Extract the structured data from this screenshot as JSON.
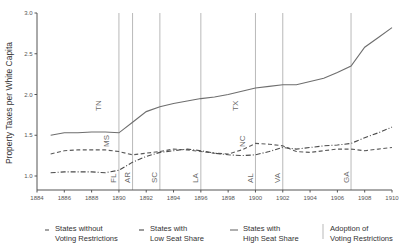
{
  "chart_data": {
    "type": "line",
    "title": "",
    "xlabel": "",
    "ylabel": "Property Taxes per White Capita",
    "xlim": [
      1884,
      1910
    ],
    "ylim": [
      0.9,
      3.05
    ],
    "xticks": [
      1884,
      1886,
      1888,
      1890,
      1892,
      1894,
      1896,
      1898,
      1900,
      1902,
      1904,
      1906,
      1908,
      1910
    ],
    "yticks": [
      1.0,
      1.5,
      2.0,
      2.5,
      3.0
    ],
    "ytick_labels": [
      "1.0",
      "1.5",
      "2.0",
      "2.5",
      "3.0"
    ],
    "xtick_labels": [
      "1884",
      "1886",
      "1888",
      "1890",
      "1892",
      "1894",
      "1896",
      "1898",
      "1900",
      "1902",
      "1904",
      "1906",
      "1908",
      "1910"
    ],
    "grid": false,
    "legend_position": "bottom",
    "x": [
      1885,
      1886,
      1887,
      1888,
      1889,
      1890,
      1891,
      1892,
      1893,
      1894,
      1895,
      1896,
      1897,
      1898,
      1899,
      1900,
      1901,
      1902,
      1903,
      1904,
      1905,
      1906,
      1907,
      1908,
      1909,
      1910
    ],
    "series": [
      {
        "name": "States with High Seat Share",
        "style": "solid",
        "values": [
          1.5,
          1.53,
          1.53,
          1.54,
          1.54,
          1.53,
          1.66,
          1.79,
          1.85,
          1.89,
          1.92,
          1.95,
          1.97,
          2.0,
          2.04,
          2.08,
          2.1,
          2.12,
          2.12,
          2.16,
          2.2,
          2.27,
          2.35,
          2.58,
          2.7,
          2.82
        ]
      },
      {
        "name": "States without Voting Restrictions",
        "style": "dashed",
        "values": [
          1.27,
          1.31,
          1.32,
          1.32,
          1.32,
          1.3,
          1.26,
          1.28,
          1.3,
          1.33,
          1.32,
          1.3,
          1.28,
          1.27,
          1.32,
          1.4,
          1.39,
          1.37,
          1.3,
          1.29,
          1.31,
          1.33,
          1.33,
          1.31,
          1.33,
          1.35
        ]
      },
      {
        "name": "States with Low Seat Share",
        "style": "dashdot",
        "values": [
          1.04,
          1.05,
          1.05,
          1.05,
          1.04,
          1.07,
          1.17,
          1.24,
          1.29,
          1.31,
          1.33,
          1.31,
          1.28,
          1.26,
          1.25,
          1.26,
          1.3,
          1.35,
          1.33,
          1.35,
          1.37,
          1.38,
          1.4,
          1.47,
          1.53,
          1.6
        ]
      }
    ],
    "vertical_lines": [
      {
        "year": 1890,
        "labels": [
          "FL",
          "MS",
          "TN"
        ]
      },
      {
        "year": 1891,
        "labels": [
          "AR"
        ]
      },
      {
        "year": 1893,
        "labels": [
          "SC"
        ]
      },
      {
        "year": 1896,
        "labels": [
          "LA"
        ]
      },
      {
        "year": 1900,
        "labels": [
          "AL",
          "NC",
          "TX"
        ]
      },
      {
        "year": 1902,
        "labels": [
          "VA"
        ]
      },
      {
        "year": 1907,
        "labels": [
          "GA"
        ]
      }
    ]
  },
  "legend": {
    "entries": [
      {
        "line1": "States without",
        "line2": "Voting Restrictions",
        "marker": "dashed"
      },
      {
        "line1": "States with",
        "line2": "Low Seat Share",
        "marker": "dashdot"
      },
      {
        "line1": "States with",
        "line2": "High Seat Share",
        "marker": "solid"
      },
      {
        "line1": "Adoption of",
        "line2": "Voting Restrictions",
        "marker": "vline"
      }
    ]
  }
}
